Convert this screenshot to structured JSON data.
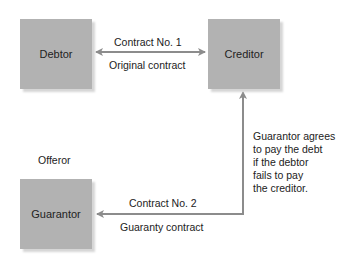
{
  "nodes": {
    "debtor": {
      "label": "Debtor"
    },
    "creditor": {
      "label": "Creditor"
    },
    "guarantor": {
      "label": "Guarantor",
      "role": "Offeror"
    }
  },
  "edges": {
    "contract1": {
      "top_label": "Contract No. 1",
      "bottom_label": "Original contract",
      "from": "Debtor",
      "to": "Creditor",
      "direction": "bidirectional"
    },
    "contract2": {
      "top_label": "Contract No. 2",
      "bottom_label": "Guaranty contract",
      "from": "Creditor",
      "to": "Guarantor",
      "direction": "Guarantor -> Creditor"
    }
  },
  "annotation": {
    "lines": [
      "Guarantor agrees",
      "to pay the debt",
      "if the debtor",
      "fails to pay",
      "the creditor."
    ]
  },
  "colors": {
    "box": "#b2b2b2",
    "box_shadow": "#d6d6d6",
    "line": "#8c8c8c"
  }
}
